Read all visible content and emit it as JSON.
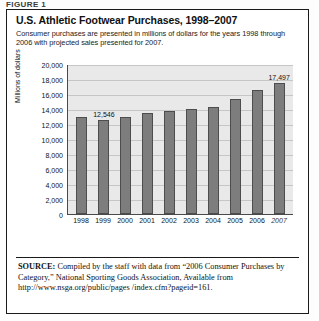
{
  "figure_label": "FIGURE 1",
  "header": {
    "title": "U.S. Athletic Footwear Purchases, 1998–2007",
    "subtitle": "Consumer purchases are presented in millions of dollars for the years 1998 through 2006 with projected sales presented for 2007."
  },
  "source": {
    "prefix": "SOURCE:",
    "text": " Compiled by the staff with data from “2006 Consumer Purchases by Category,” National Sporting Goods Association, Available from http://www.nsga.org/public/pages /index.cfm?pageid=161."
  },
  "chart_data": {
    "type": "bar",
    "title": "U.S. Athletic Footwear Purchases, 1998–2007",
    "xlabel": "",
    "ylabel": "Millions of dollars",
    "ylim": [
      0,
      20000
    ],
    "ytick_step": 2000,
    "grid": true,
    "legend": "none",
    "categories": [
      "1998",
      "1999",
      "2000",
      "2001",
      "2002",
      "2003",
      "2004",
      "2005",
      "2006",
      "2007"
    ],
    "values": [
      13000,
      12546,
      12900,
      13500,
      13800,
      14000,
      14300,
      15400,
      16500,
      17497
    ],
    "ytick_labels": [
      "20,000",
      "18,000",
      "16,000",
      "14,000",
      "12,000",
      "10,000",
      "8,000",
      "6,000",
      "4,000",
      "2,000",
      "0"
    ],
    "point_labels": [
      {
        "category": "1999",
        "label": "12,546"
      },
      {
        "category": "2007",
        "label": "17,497"
      }
    ],
    "projected_categories": [
      "2007"
    ],
    "colors": {
      "bar_fill": "#7d7d7d",
      "bar_border": "#4d4d4d",
      "plot_background": "#e9e9e9",
      "gridline": "#c6c6c6",
      "axis": "#4a4a4a"
    }
  }
}
